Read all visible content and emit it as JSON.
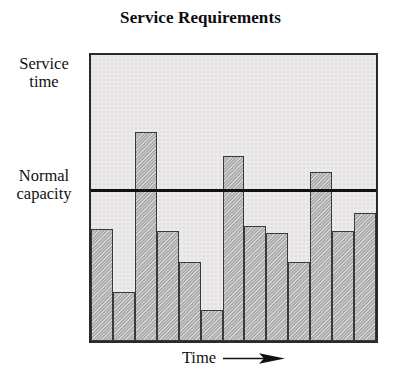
{
  "chart_data": {
    "type": "bar",
    "title": "Service Requirements",
    "xlabel": "Time",
    "ylabel": "Service time",
    "xlabel_arrow": "right-arrow",
    "categories": [
      "1",
      "2",
      "3",
      "4",
      "5",
      "6",
      "7",
      "8",
      "9",
      "10",
      "11",
      "12",
      "13"
    ],
    "values": [
      0.39,
      0.172,
      0.731,
      0.386,
      0.276,
      0.107,
      0.648,
      0.403,
      0.376,
      0.276,
      0.59,
      0.386,
      0.448
    ],
    "ylim": [
      0,
      1
    ],
    "grid": false,
    "legend": null,
    "annotations": [
      {
        "name": "normal-capacity",
        "label": "Normal capacity",
        "type": "horizontal-threshold-line",
        "value": 0.52
      },
      {
        "name": "service-time-axis",
        "label": "Service time",
        "type": "axis-title"
      }
    ],
    "colors": {
      "bar_fill": "#b9b9b9",
      "bar_stroke": "#3a3a3a",
      "plot_background": "#eceaea",
      "frame": "#2a2a2a",
      "capacity_line": "#111111",
      "text": "#111111",
      "page_background": "#ffffff"
    },
    "bars_above_capacity": [
      3,
      7,
      11
    ]
  },
  "title": {
    "text": "Service Requirements"
  },
  "axes": {
    "y_top_label_line1": "Service",
    "y_top_label_line2": "time",
    "y_mid_label_line1": "Normal",
    "y_mid_label_line2": "capacity",
    "x_label": "Time"
  }
}
